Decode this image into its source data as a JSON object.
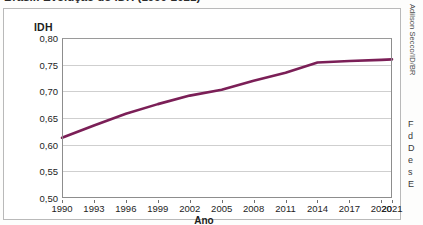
{
  "figure": {
    "caption_clipped": "Brasil: Evolução do IDH (1990-2021)",
    "credit": "Adilson Secco/ID/BR"
  },
  "axes": {
    "y_title": "IDH",
    "x_title": "Ano",
    "y_ticks": [
      "0,80",
      "0,75",
      "0,70",
      "0,65",
      "0,60",
      "0,55",
      "0,50"
    ],
    "x_ticks": [
      "1990",
      "1993",
      "1996",
      "1999",
      "2002",
      "2005",
      "2008",
      "2011",
      "2014",
      "2017",
      "2020",
      "2021"
    ]
  },
  "side_column": {
    "lines": [
      "F",
      "d",
      "D",
      "e",
      "s",
      "E"
    ]
  },
  "chart_data": {
    "type": "line",
    "title": "Brasil: Evolução do IDH (1990-2021)",
    "xlabel": "Ano",
    "ylabel": "IDH",
    "xlim": [
      1990,
      2021
    ],
    "ylim": [
      0.5,
      0.8
    ],
    "y_tick_values": [
      0.8,
      0.75,
      0.7,
      0.65,
      0.6,
      0.55,
      0.5
    ],
    "x_tick_values": [
      1990,
      1993,
      1996,
      1999,
      2002,
      2005,
      2008,
      2011,
      2014,
      2017,
      2020,
      2021
    ],
    "grid": "horizontal",
    "legend": "none",
    "line_color": "#7B1F57",
    "series": [
      {
        "name": "IDH do Brasil",
        "x": [
          1990,
          1993,
          1996,
          1999,
          2002,
          2005,
          2008,
          2011,
          2014,
          2017,
          2020,
          2021
        ],
        "values": [
          0.613,
          0.636,
          0.658,
          0.676,
          0.692,
          0.703,
          0.72,
          0.735,
          0.754,
          0.757,
          0.759,
          0.76
        ]
      }
    ]
  }
}
